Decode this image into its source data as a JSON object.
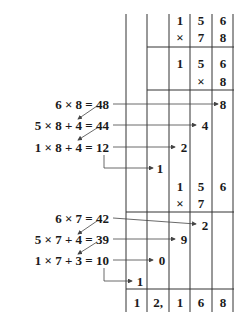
{
  "diagram": {
    "columns_x": [
      126,
      147,
      169,
      190,
      212,
      234
    ],
    "full_problem": {
      "multiplicand": [
        "1",
        "5",
        "6"
      ],
      "multiplier": [
        "×",
        "7",
        "8"
      ]
    },
    "step1": {
      "multiplicand": [
        "1",
        "5",
        "6"
      ],
      "multiplier": [
        "×",
        "8"
      ],
      "equations": [
        {
          "text": "6 × 8 = 48",
          "result_digit": "8"
        },
        {
          "text": "5 × 8 + 4 = 44",
          "result_digit": "4"
        },
        {
          "text": "1 × 8 + 4 = 12",
          "result_digit": "2"
        }
      ],
      "carry_out": "1"
    },
    "step2": {
      "multiplicand": [
        "1",
        "5",
        "6"
      ],
      "multiplier": [
        "×",
        "7"
      ],
      "equations": [
        {
          "text": "6 × 7 = 42",
          "result_digit": "2"
        },
        {
          "text": "5 × 7 + 4 = 39",
          "result_digit": "9"
        },
        {
          "text": "1 × 7 + 3 = 10",
          "result_digit": "0"
        }
      ],
      "carry_out": "1"
    },
    "final_result": [
      "1",
      "2,",
      "1",
      "6",
      "8"
    ],
    "colors": {
      "ink": "#1a1a1a",
      "arrow": "#555555"
    }
  }
}
